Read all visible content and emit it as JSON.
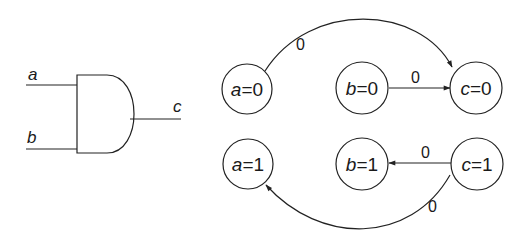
{
  "gate": {
    "type": "AND",
    "inputs": [
      "a",
      "b"
    ],
    "output": "c"
  },
  "nodes": [
    {
      "id": "a0",
      "var": "a",
      "eq": "=",
      "val": "0",
      "cx": 247,
      "cy": 89
    },
    {
      "id": "b0",
      "var": "b",
      "eq": "=",
      "val": "0",
      "cx": 362,
      "cy": 88
    },
    {
      "id": "c0",
      "var": "c",
      "eq": "=",
      "val": "0",
      "cx": 476,
      "cy": 88
    },
    {
      "id": "a1",
      "var": "a",
      "eq": "=",
      "val": "1",
      "cx": 248,
      "cy": 164
    },
    {
      "id": "b1",
      "var": "b",
      "eq": "=",
      "val": "1",
      "cx": 362,
      "cy": 164
    },
    {
      "id": "c1",
      "var": "c",
      "eq": "=",
      "val": "1",
      "cx": 477,
      "cy": 164
    }
  ],
  "edges": [
    {
      "from": "a0",
      "to": "c0",
      "label": "0"
    },
    {
      "from": "b0",
      "to": "c0",
      "label": "0"
    },
    {
      "from": "c1",
      "to": "b1",
      "label": "0"
    },
    {
      "from": "c1",
      "to": "a1",
      "label": "0"
    }
  ],
  "colors": {
    "stroke": "#222222",
    "background": "#ffffff"
  }
}
